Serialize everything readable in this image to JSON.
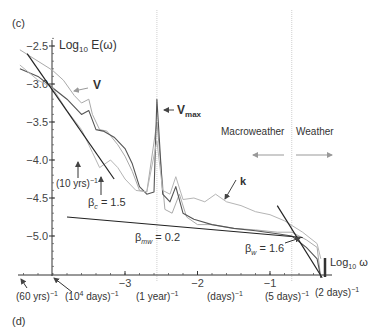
{
  "chart_data": {
    "type": "line",
    "panel_label": "(c)",
    "next_panel_label": "(d)",
    "ylabel": "Log10 E(ω)",
    "xlabel": "Log10 ω",
    "xlim": [
      -4.45,
      -0.15
    ],
    "ylim": [
      -5.5,
      -2.4
    ],
    "grid": false,
    "yticks": [
      {
        "value": -2.5,
        "label": "−2.5"
      },
      {
        "value": -3.0,
        "label": "−3.0"
      },
      {
        "value": -3.5,
        "label": "−3.5"
      },
      {
        "value": -4.0,
        "label": "−4.0"
      },
      {
        "value": -4.5,
        "label": "−4.5"
      },
      {
        "value": -5.0,
        "label": "−5.0"
      }
    ],
    "xticks": [
      {
        "value": -3,
        "label": "−3"
      },
      {
        "value": -2,
        "label": "−2"
      },
      {
        "value": -1,
        "label": "−1"
      }
    ],
    "vertical_reference_lines": [
      {
        "x": -2.56,
        "name": "one-year"
      },
      {
        "x": -0.7,
        "name": "macro-weather-boundary"
      }
    ],
    "series": [
      {
        "name": "V",
        "style": "light",
        "color": "#aaaaaa",
        "points": [
          [
            -4.45,
            -2.55
          ],
          [
            -4.0,
            -2.82
          ],
          [
            -3.85,
            -2.95
          ],
          [
            -3.7,
            -3.15
          ],
          [
            -3.6,
            -3.25
          ],
          [
            -3.5,
            -3.2
          ],
          [
            -3.45,
            -3.4
          ],
          [
            -3.35,
            -3.6
          ],
          [
            -3.25,
            -3.62
          ],
          [
            -3.1,
            -3.8
          ],
          [
            -3.0,
            -3.95
          ],
          [
            -2.9,
            -4.15
          ],
          [
            -2.8,
            -4.4
          ],
          [
            -2.7,
            -4.42
          ],
          [
            -2.56,
            -3.5
          ],
          [
            -2.45,
            -4.65
          ],
          [
            -2.35,
            -4.7
          ],
          [
            -2.25,
            -4.45
          ],
          [
            -2.15,
            -4.75
          ],
          [
            -2.0,
            -4.85
          ],
          [
            -1.8,
            -4.85
          ],
          [
            -1.5,
            -4.9
          ],
          [
            -1.2,
            -4.92
          ],
          [
            -0.9,
            -4.95
          ],
          [
            -0.7,
            -4.95
          ],
          [
            -0.5,
            -5.05
          ],
          [
            -0.35,
            -5.15
          ],
          [
            -0.3,
            -5.55
          ]
        ]
      },
      {
        "name": "Vmax",
        "style": "dark",
        "color": "#555555",
        "points": [
          [
            -4.45,
            -2.8
          ],
          [
            -4.2,
            -2.9
          ],
          [
            -4.0,
            -3.05
          ],
          [
            -3.8,
            -3.2
          ],
          [
            -3.6,
            -3.4
          ],
          [
            -3.5,
            -3.35
          ],
          [
            -3.4,
            -3.6
          ],
          [
            -3.3,
            -3.62
          ],
          [
            -3.15,
            -3.7
          ],
          [
            -3.0,
            -3.85
          ],
          [
            -2.9,
            -4.05
          ],
          [
            -2.8,
            -4.35
          ],
          [
            -2.7,
            -4.45
          ],
          [
            -2.6,
            -4.42
          ],
          [
            -2.56,
            -3.2
          ],
          [
            -2.48,
            -4.45
          ],
          [
            -2.38,
            -4.55
          ],
          [
            -2.3,
            -4.35
          ],
          [
            -2.2,
            -4.7
          ],
          [
            -2.05,
            -4.78
          ],
          [
            -1.8,
            -4.85
          ],
          [
            -1.5,
            -4.9
          ],
          [
            -1.2,
            -4.93
          ],
          [
            -0.9,
            -4.97
          ],
          [
            -0.7,
            -5.0
          ],
          [
            -0.5,
            -5.15
          ],
          [
            -0.35,
            -5.3
          ],
          [
            -0.3,
            -5.55
          ]
        ]
      },
      {
        "name": "k",
        "style": "light",
        "color": "#b5b5b5",
        "points": [
          [
            -4.45,
            -2.75
          ],
          [
            -4.2,
            -2.95
          ],
          [
            -4.0,
            -3.05
          ],
          [
            -3.8,
            -3.35
          ],
          [
            -3.6,
            -3.6
          ],
          [
            -3.45,
            -3.9
          ],
          [
            -3.35,
            -4.1
          ],
          [
            -3.2,
            -4.0
          ],
          [
            -3.1,
            -4.1
          ],
          [
            -3.0,
            -4.25
          ],
          [
            -2.85,
            -4.4
          ],
          [
            -2.7,
            -4.42
          ],
          [
            -2.56,
            -3.75
          ],
          [
            -2.48,
            -4.4
          ],
          [
            -2.38,
            -4.45
          ],
          [
            -2.3,
            -4.22
          ],
          [
            -2.2,
            -4.52
          ],
          [
            -2.05,
            -4.5
          ],
          [
            -1.9,
            -4.55
          ],
          [
            -1.75,
            -4.45
          ],
          [
            -1.6,
            -4.55
          ],
          [
            -1.4,
            -4.6
          ],
          [
            -1.2,
            -4.68
          ],
          [
            -1.0,
            -4.72
          ],
          [
            -0.8,
            -4.8
          ],
          [
            -0.55,
            -4.95
          ],
          [
            -0.35,
            -5.1
          ],
          [
            -0.3,
            -5.3
          ]
        ]
      }
    ],
    "fit_lines": [
      {
        "name": "beta_c",
        "label": "βc = 1.5",
        "points": [
          [
            -4.35,
            -2.6
          ],
          [
            -3.15,
            -4.25
          ]
        ]
      },
      {
        "name": "beta_mw",
        "label": "βmw = 0.2",
        "points": [
          [
            -3.8,
            -4.75
          ],
          [
            -0.55,
            -5.02
          ]
        ]
      },
      {
        "name": "beta_w",
        "label": "βw = 1.6",
        "points": [
          [
            -0.9,
            -4.6
          ],
          [
            -0.28,
            -5.55
          ]
        ]
      }
    ],
    "annotations": {
      "V": "V",
      "Vmax_main": "V",
      "Vmax_sub": "max",
      "k": "k",
      "macroweather": "Macroweather",
      "weather": "Weather",
      "ten_years": "(10 yrs)",
      "beta_c_greek": "β",
      "beta_c_sub": "c",
      "beta_c_val": " = 1.5",
      "beta_mw_greek": "β",
      "beta_mw_sub": "mw",
      "beta_mw_val": " = 0.2",
      "beta_w_greek": "β",
      "beta_w_sub": "w",
      "beta_w_val": " = 1.6",
      "ylabel_main": "Log",
      "ylabel_sub": "10",
      "ylabel_tail": " E(ω)",
      "xlabel_main": "Log",
      "xlabel_sub": "10",
      "xlabel_tail": " ω",
      "inv": "−1"
    },
    "x_period_labels": [
      {
        "text": "(60 yrs)",
        "name": "sixty-years"
      },
      {
        "text": "(10",
        "sup": "4",
        "text2": " days)",
        "name": "ten-thousand-days"
      },
      {
        "text": "(1 year)",
        "name": "one-year"
      },
      {
        "text": "(days)",
        "name": "days"
      },
      {
        "text": "(5 days)",
        "name": "five-days"
      },
      {
        "text": "(2 days)",
        "name": "two-days"
      }
    ]
  }
}
